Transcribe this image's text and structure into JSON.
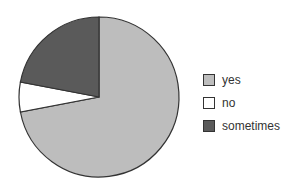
{
  "chart_data": {
    "type": "pie",
    "title": "",
    "categories": [
      "yes",
      "no",
      "sometimes"
    ],
    "values": [
      72,
      6,
      22
    ],
    "colors": [
      "#bdbdbd",
      "#ffffff",
      "#5a5a5a"
    ],
    "start_angle_deg": 0,
    "direction": "clockwise",
    "legend_position": "right"
  },
  "legend": {
    "items": [
      {
        "label": "yes",
        "color": "#bdbdbd"
      },
      {
        "label": "no",
        "color": "#ffffff"
      },
      {
        "label": "sometimes",
        "color": "#5a5a5a"
      }
    ]
  }
}
